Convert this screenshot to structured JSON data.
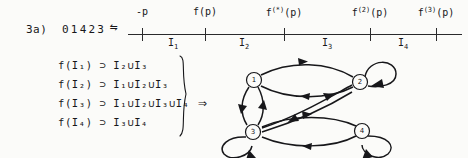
{
  "figure": {
    "item_label": "3a)",
    "code_word": "01423",
    "equivalence_symbol": "⇋",
    "implies_symbol": "⇒"
  },
  "number_line": {
    "tick_positions_px": [
      14,
      77,
      156,
      242,
      308
    ],
    "top_labels": [
      {
        "text": "-p",
        "sup": "",
        "x": 14
      },
      {
        "text": "f(p)",
        "sup": "",
        "x": 77
      },
      {
        "text": "f",
        "sup": "(*)",
        "suffix": "(p)",
        "x": 156
      },
      {
        "text": "f",
        "sup": "(2)",
        "suffix": "(p)",
        "x": 242
      },
      {
        "text": "f",
        "sup": "(3)",
        "suffix": "(p)",
        "x": 308
      }
    ],
    "interval_labels": [
      {
        "name": "I",
        "sub": "1",
        "x": 45
      },
      {
        "name": "I",
        "sub": "2",
        "x": 116
      },
      {
        "name": "I",
        "sub": "3",
        "x": 199
      },
      {
        "name": "I",
        "sub": "4",
        "x": 275
      }
    ]
  },
  "equations": [
    {
      "lhs_f": "f(I",
      "lhs_sub": "1",
      "lhs_close": ")",
      "op": "⊃",
      "rhs": [
        {
          "sym": "I",
          "sub": "2"
        },
        {
          "sym": "I",
          "sub": "3"
        }
      ]
    },
    {
      "lhs_f": "f(I",
      "lhs_sub": "2",
      "lhs_close": ")",
      "op": "⊃",
      "rhs": [
        {
          "sym": "I",
          "sub": "1"
        },
        {
          "sym": "I",
          "sub": "2"
        },
        {
          "sym": "I",
          "sub": "3"
        }
      ]
    },
    {
      "lhs_f": "f(I",
      "lhs_sub": "3",
      "lhs_close": ")",
      "op": "⊃",
      "rhs": [
        {
          "sym": "I",
          "sub": "1"
        },
        {
          "sym": "I",
          "sub": "2"
        },
        {
          "sym": "I",
          "sub": "3"
        },
        {
          "sym": "I",
          "sub": "4"
        }
      ]
    },
    {
      "lhs_f": "f(I",
      "lhs_sub": "4",
      "lhs_close": ")",
      "op": "⊃",
      "rhs": [
        {
          "sym": "I",
          "sub": "3"
        },
        {
          "sym": "I",
          "sub": "4"
        }
      ]
    }
  ],
  "equation_text": {
    "union_symbol": "∪",
    "line1": "f(I₁) ⊃ I₂∪I₃",
    "line2": "f(I₂) ⊃ I₁∪I₂∪I₃",
    "line3": "f(I₃) ⊃ I₁∪I₂∪I₃∪I₄",
    "line4": "f(I₄) ⊃ I₃∪I₄"
  },
  "graph": {
    "nodes": [
      {
        "id": "1",
        "label": "1",
        "cx": 38,
        "cy": 28
      },
      {
        "id": "2",
        "label": "2",
        "cx": 144,
        "cy": 30
      },
      {
        "id": "3",
        "label": "3",
        "cx": 37,
        "cy": 80
      },
      {
        "id": "4",
        "label": "4",
        "cx": 146,
        "cy": 79
      }
    ],
    "edges": [
      {
        "from": "1",
        "to": "2",
        "kind": "arc"
      },
      {
        "from": "2",
        "to": "1",
        "kind": "arc"
      },
      {
        "from": "1",
        "to": "3",
        "kind": "arc"
      },
      {
        "from": "3",
        "to": "1",
        "kind": "arc"
      },
      {
        "from": "3",
        "to": "2",
        "kind": "arc"
      },
      {
        "from": "2",
        "to": "3",
        "kind": "arc"
      },
      {
        "from": "3",
        "to": "4",
        "kind": "arc"
      },
      {
        "from": "4",
        "to": "3",
        "kind": "arc"
      },
      {
        "from": "2",
        "to": "2",
        "kind": "self-loop"
      },
      {
        "from": "3",
        "to": "3",
        "kind": "self-loop"
      },
      {
        "from": "4",
        "to": "4",
        "kind": "self-loop"
      }
    ]
  }
}
